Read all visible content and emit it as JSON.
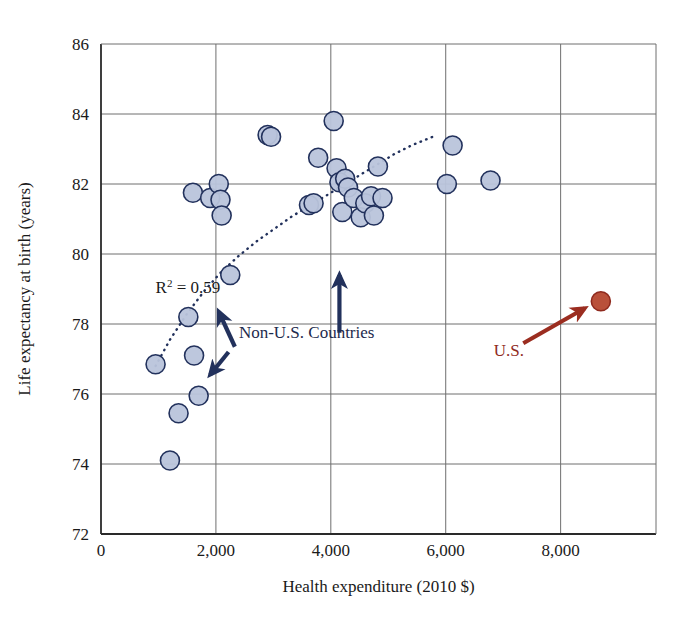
{
  "chart_data": {
    "type": "scatter",
    "title": "",
    "xlabel": "Health expenditure (2010 $)",
    "ylabel": "Life expectancy at birth (years)",
    "xlim": [
      0,
      9660
    ],
    "ylim": [
      72,
      86
    ],
    "xticks": [
      0,
      2000,
      4000,
      6000,
      8000
    ],
    "xtick_labels": [
      "0",
      "2,000",
      "4,000",
      "6,000",
      "8,000"
    ],
    "yticks": [
      72,
      74,
      76,
      78,
      80,
      82,
      84,
      86
    ],
    "ytick_labels": [
      "72",
      "74",
      "76",
      "78",
      "80",
      "82",
      "84",
      "86"
    ],
    "grid": true,
    "legend_position": "none",
    "annotations": [
      {
        "name": "r2-annotation",
        "text": "R² = 0.59",
        "base": "R",
        "sup": "2",
        "rest": " = 0.59",
        "x": 950,
        "y": 78.9
      },
      {
        "name": "non-us-label",
        "text": "Non-U.S. Countries",
        "x": 2400,
        "y": 77.6
      },
      {
        "name": "us-label",
        "text": "U.S.",
        "x": 7100,
        "y": 77.1
      }
    ],
    "series": [
      {
        "name": "Non-U.S. Countries",
        "marker": "circle",
        "color": "#b9c4db",
        "edge_color": "#22315c",
        "points": [
          [
            950,
            76.85
          ],
          [
            1200,
            74.1
          ],
          [
            1350,
            75.45
          ],
          [
            1520,
            78.2
          ],
          [
            1600,
            81.75
          ],
          [
            1620,
            77.1
          ],
          [
            1700,
            75.95
          ],
          [
            1900,
            81.6
          ],
          [
            2050,
            82.0
          ],
          [
            2080,
            81.55
          ],
          [
            2100,
            81.1
          ],
          [
            2250,
            79.4
          ],
          [
            2900,
            83.4
          ],
          [
            2960,
            83.35
          ],
          [
            3620,
            81.4
          ],
          [
            3700,
            81.45
          ],
          [
            3780,
            82.75
          ],
          [
            4050,
            83.8
          ],
          [
            4100,
            82.45
          ],
          [
            4150,
            82.05
          ],
          [
            4200,
            81.2
          ],
          [
            4250,
            82.15
          ],
          [
            4300,
            81.9
          ],
          [
            4400,
            81.6
          ],
          [
            4520,
            81.05
          ],
          [
            4600,
            81.45
          ],
          [
            4700,
            81.65
          ],
          [
            4750,
            81.1
          ],
          [
            4820,
            82.5
          ],
          [
            4900,
            81.6
          ],
          [
            6020,
            82.0
          ],
          [
            6120,
            83.1
          ],
          [
            6780,
            82.1
          ]
        ]
      },
      {
        "name": "U.S.",
        "marker": "circle",
        "color": "#b5472f",
        "edge_color": "#8f2a1e",
        "points": [
          [
            8700,
            78.65
          ]
        ]
      }
    ],
    "trendline": {
      "name": "logarithmic-fit",
      "style": "dotted",
      "color": "#22315c",
      "r_squared": 0.59,
      "points": [
        [
          950,
          76.8
        ],
        [
          1200,
          77.55
        ],
        [
          1500,
          78.3
        ],
        [
          1800,
          78.95
        ],
        [
          2100,
          79.5
        ],
        [
          2400,
          79.95
        ],
        [
          2700,
          80.35
        ],
        [
          3000,
          80.7
        ],
        [
          3300,
          81.05
        ],
        [
          3600,
          81.35
        ],
        [
          3900,
          81.65
        ],
        [
          4200,
          81.95
        ],
        [
          4500,
          82.25
        ],
        [
          4800,
          82.55
        ],
        [
          5100,
          82.85
        ],
        [
          5400,
          83.1
        ],
        [
          5700,
          83.3
        ],
        [
          5850,
          83.4
        ]
      ]
    },
    "arrows": [
      {
        "name": "arrow-to-left-cluster",
        "color": "#22315c",
        "x1": 2330,
        "y1": 77.35,
        "x2": 2050,
        "y2": 78.35
      },
      {
        "name": "arrow-to-center-cluster",
        "color": "#22315c",
        "x1": 4150,
        "y1": 77.75,
        "x2": 4150,
        "y2": 79.4
      },
      {
        "name": "arrow-to-lower-left-point",
        "color": "#22315c",
        "x1": 2220,
        "y1": 77.2,
        "x2": 1900,
        "y2": 76.55
      },
      {
        "name": "arrow-to-us-point",
        "color": "#9b2d20",
        "x1": 7350,
        "y1": 77.45,
        "x2": 8420,
        "y2": 78.45
      }
    ]
  }
}
